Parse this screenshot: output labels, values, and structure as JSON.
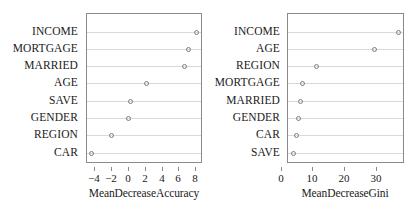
{
  "chart_data": [
    {
      "type": "scatter",
      "name": "mean-decrease-accuracy",
      "title": "",
      "xlabel": "MeanDecreaseAccuracy",
      "ylabel": "",
      "xlim": [
        -5.0,
        8.8
      ],
      "xticks": [
        -4,
        -2,
        0,
        2,
        4,
        6,
        8
      ],
      "xticklabels": [
        "−4",
        "−2",
        "0",
        "2",
        "4",
        "6",
        "8"
      ],
      "grid": true,
      "legend": "none",
      "categories": [
        "INCOME",
        "MORTGAGE",
        "MARRIED",
        "AGE",
        "SAVE",
        "GENDER",
        "REGION",
        "CAR"
      ],
      "values": [
        8.2,
        7.3,
        6.8,
        2.3,
        0.4,
        0.1,
        -1.9,
        -4.3
      ]
    },
    {
      "type": "scatter",
      "name": "mean-decrease-gini",
      "title": "",
      "xlabel": "MeanDecreaseGini",
      "ylabel": "",
      "xlim": [
        2.0,
        39.0
      ],
      "xticks": [
        0,
        10,
        20,
        30
      ],
      "xticklabels": [
        "0",
        "10",
        "20",
        "30"
      ],
      "grid": true,
      "legend": "none",
      "categories": [
        "INCOME",
        "AGE",
        "REGION",
        "MORTGAGE",
        "MARRIED",
        "GENDER",
        "CAR",
        "SAVE"
      ],
      "values": [
        37.5,
        29.8,
        11.6,
        7.0,
        6.4,
        5.9,
        5.1,
        4.2
      ]
    }
  ],
  "panels": {
    "accuracy": {
      "axis_title": "MeanDecreaseAccuracy",
      "tick_labels": [
        "−4",
        "−2",
        "0",
        "2",
        "4",
        "6",
        "8"
      ],
      "categories": [
        "INCOME",
        "MORTGAGE",
        "MARRIED",
        "AGE",
        "SAVE",
        "GENDER",
        "REGION",
        "CAR"
      ]
    },
    "gini": {
      "axis_title": "MeanDecreaseGini",
      "tick_labels": [
        "0",
        "10",
        "20",
        "30"
      ],
      "categories": [
        "INCOME",
        "AGE",
        "REGION",
        "MORTGAGE",
        "MARRIED",
        "GENDER",
        "CAR",
        "SAVE"
      ]
    }
  },
  "colors": {
    "box_border": "#8a8a8a",
    "gridline": "#d9d9d9",
    "point_stroke": "#7d7d7d",
    "text": "#1a1a1a",
    "background": "#ffffff"
  }
}
